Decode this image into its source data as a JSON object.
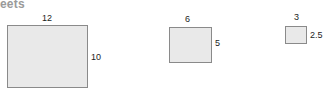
{
  "page": {
    "breadcrumb_fragment": "eets"
  },
  "diagram": {
    "type": "similar-rectangles-diagram",
    "figures": [
      {
        "id": "figure-1",
        "width_label": "12",
        "height_label": "10",
        "width_value": 12,
        "height_value": 10
      },
      {
        "id": "figure-2",
        "width_label": "6",
        "height_label": "5",
        "width_value": 6,
        "height_value": 5
      },
      {
        "id": "figure-3",
        "width_label": "3",
        "height_label": "2.5",
        "width_value": 3,
        "height_value": 2.5
      }
    ]
  },
  "style": {
    "fill": "#e9e9e9",
    "stroke": "#8a8a8a",
    "label_color": "#1d1d1d",
    "breadcrumb_color": "#9a9a9a",
    "background": "#ffffff"
  }
}
